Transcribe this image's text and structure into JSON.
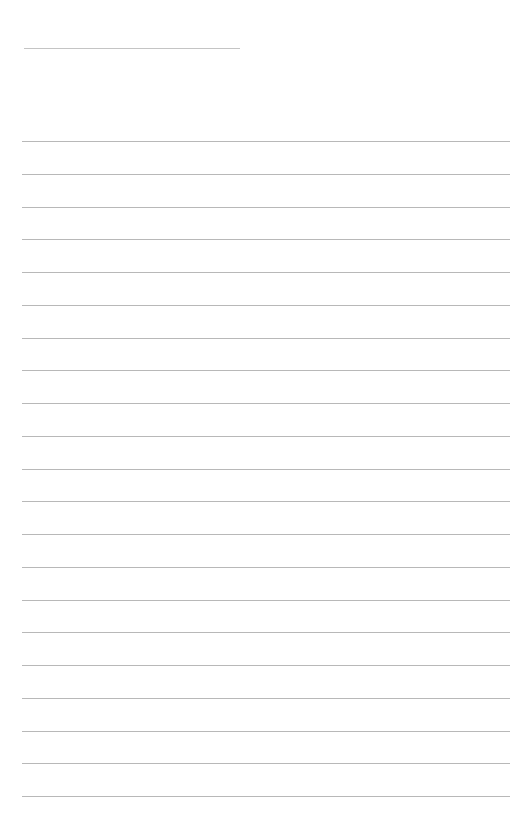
{
  "page": {
    "type": "blank lined paper",
    "background_color": "#ffffff",
    "rule_color": "#b8b8b8",
    "header_rule": {
      "x1": 24,
      "x2": 240,
      "y": 48
    },
    "body_rules": {
      "count": 21,
      "first_y": 141,
      "spacing": 32.75,
      "x_start": 22,
      "x_end": 510
    }
  }
}
